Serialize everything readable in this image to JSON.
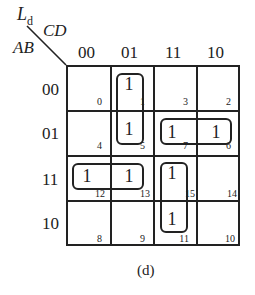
{
  "title": {
    "function": "L",
    "subscript": "d"
  },
  "axes": {
    "column_vars": "CD",
    "row_vars": "AB"
  },
  "columns": [
    "00",
    "01",
    "11",
    "10"
  ],
  "rows": [
    "00",
    "01",
    "11",
    "10"
  ],
  "cells": [
    {
      "index": "0",
      "value": ""
    },
    {
      "index": "1",
      "value": "1"
    },
    {
      "index": "3",
      "value": ""
    },
    {
      "index": "2",
      "value": ""
    },
    {
      "index": "4",
      "value": ""
    },
    {
      "index": "5",
      "value": "1"
    },
    {
      "index": "7",
      "value": "1"
    },
    {
      "index": "6",
      "value": "1"
    },
    {
      "index": "12",
      "value": "1"
    },
    {
      "index": "13",
      "value": "1"
    },
    {
      "index": "15",
      "value": "1"
    },
    {
      "index": "14",
      "value": ""
    },
    {
      "index": "8",
      "value": ""
    },
    {
      "index": "9",
      "value": ""
    },
    {
      "index": "11",
      "value": "1"
    },
    {
      "index": "10",
      "value": ""
    }
  ],
  "groups": [
    {
      "cells": [
        "1",
        "5"
      ]
    },
    {
      "cells": [
        "7",
        "6"
      ]
    },
    {
      "cells": [
        "12",
        "13"
      ]
    },
    {
      "cells": [
        "15",
        "11"
      ]
    }
  ],
  "caption": "(d)"
}
